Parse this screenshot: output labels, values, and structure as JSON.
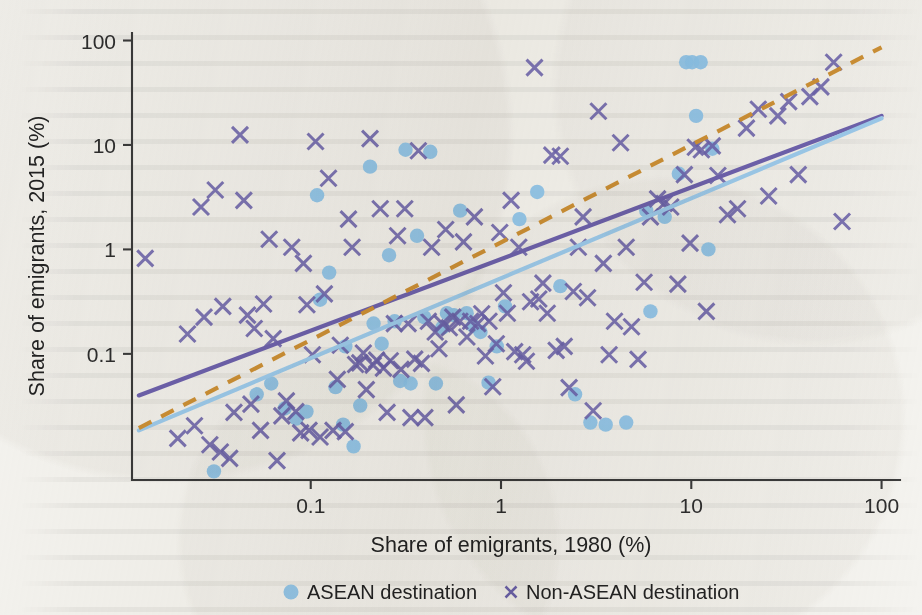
{
  "figure": {
    "background_color": "#f4f3ef",
    "axis_color": "#3b3b3b"
  },
  "chart_data": {
    "type": "scatter",
    "title": "",
    "xlabel": "Share of emigrants, 1980 (%)",
    "ylabel": "Share of emigrants, 2015 (%)",
    "xscale": "log",
    "yscale": "log",
    "xlim": [
      0.0115,
      125
    ],
    "ylim": [
      0.0062,
      118
    ],
    "xticks": [
      0.1,
      1,
      10,
      100
    ],
    "xtick_labels": [
      "0.1",
      "1",
      "10",
      "100"
    ],
    "yticks": [
      0.1,
      1,
      10,
      100
    ],
    "ytick_labels": [
      "0.1",
      "1",
      "10",
      "100"
    ],
    "grid": false,
    "legend_position": "below-axes",
    "colors": {
      "asean": "#8cc3ea",
      "non_asean": "#6c63ad",
      "fit_all": "#6f63b0",
      "fit_asean": "#9ecdf0",
      "fit_non_asean_dashed": "#cf9236"
    },
    "legend": [
      {
        "label": "ASEAN destination",
        "marker": "circle",
        "color": "#8cc3ea"
      },
      {
        "label": "Non-ASEAN destination",
        "marker": "cross",
        "color": "#6c63ad"
      }
    ],
    "series": [
      {
        "name": "ASEAN destination",
        "marker": "circle",
        "color": "#8cc3ea",
        "points": [
          [
            0.031,
            0.0075
          ],
          [
            0.052,
            0.041
          ],
          [
            0.062,
            0.052
          ],
          [
            0.073,
            0.03
          ],
          [
            0.084,
            0.024
          ],
          [
            0.095,
            0.028
          ],
          [
            0.108,
            3.3
          ],
          [
            0.112,
            0.33
          ],
          [
            0.125,
            0.6
          ],
          [
            0.135,
            0.048
          ],
          [
            0.148,
            0.021
          ],
          [
            0.152,
            0.118
          ],
          [
            0.168,
            0.013
          ],
          [
            0.182,
            0.032
          ],
          [
            0.205,
            6.2
          ],
          [
            0.214,
            0.195
          ],
          [
            0.236,
            0.125
          ],
          [
            0.258,
            0.88
          ],
          [
            0.276,
            0.205
          ],
          [
            0.295,
            0.055
          ],
          [
            0.315,
            9.0
          ],
          [
            0.335,
            0.052
          ],
          [
            0.362,
            1.35
          ],
          [
            0.395,
            0.225
          ],
          [
            0.425,
            8.6
          ],
          [
            0.455,
            0.052
          ],
          [
            0.492,
            0.178
          ],
          [
            0.52,
            0.245
          ],
          [
            0.565,
            0.235
          ],
          [
            0.61,
            2.35
          ],
          [
            0.66,
            0.245
          ],
          [
            0.715,
            0.185
          ],
          [
            0.78,
            0.162
          ],
          [
            0.86,
            0.053
          ],
          [
            0.95,
            0.118
          ],
          [
            1.05,
            0.285
          ],
          [
            1.25,
            1.95
          ],
          [
            1.55,
            3.55
          ],
          [
            2.05,
            0.445
          ],
          [
            2.45,
            0.041
          ],
          [
            2.95,
            0.022
          ],
          [
            3.55,
            0.021
          ],
          [
            4.55,
            0.022
          ],
          [
            5.8,
            2.35
          ],
          [
            6.1,
            0.255
          ],
          [
            7.25,
            2.05
          ],
          [
            8.6,
            5.3
          ],
          [
            9.4,
            62
          ],
          [
            10.1,
            62
          ],
          [
            10.6,
            19
          ],
          [
            11.2,
            62
          ],
          [
            12.3,
            1.0
          ],
          [
            12.9,
            9.2
          ]
        ]
      },
      {
        "name": "Non-ASEAN destination",
        "marker": "cross",
        "color": "#6c63ad",
        "points": [
          [
            0.0135,
            0.82
          ],
          [
            0.02,
            0.0155
          ],
          [
            0.0225,
            0.155
          ],
          [
            0.0245,
            0.0205
          ],
          [
            0.0265,
            2.55
          ],
          [
            0.0275,
            0.225
          ],
          [
            0.0295,
            0.0135
          ],
          [
            0.0315,
            3.7
          ],
          [
            0.0335,
            0.0115
          ],
          [
            0.0345,
            0.285
          ],
          [
            0.0375,
            0.01
          ],
          [
            0.0395,
            0.0275
          ],
          [
            0.0425,
            12.5
          ],
          [
            0.0445,
            2.95
          ],
          [
            0.0465,
            0.235
          ],
          [
            0.0485,
            0.033
          ],
          [
            0.0505,
            0.175
          ],
          [
            0.0545,
            0.0185
          ],
          [
            0.0565,
            0.3
          ],
          [
            0.0605,
            1.25
          ],
          [
            0.0635,
            0.14
          ],
          [
            0.0665,
            0.0095
          ],
          [
            0.0705,
            0.0255
          ],
          [
            0.0745,
            0.0355
          ],
          [
            0.0795,
            1.05
          ],
          [
            0.0835,
            0.028
          ],
          [
            0.0885,
            0.0175
          ],
          [
            0.0915,
            0.735
          ],
          [
            0.0955,
            0.295
          ],
          [
            0.098,
            0.0185
          ],
          [
            0.102,
            0.098
          ],
          [
            0.106,
            10.8
          ],
          [
            0.112,
            0.016
          ],
          [
            0.118,
            0.375
          ],
          [
            0.124,
            4.8
          ],
          [
            0.131,
            0.0185
          ],
          [
            0.138,
            0.057
          ],
          [
            0.143,
            0.121
          ],
          [
            0.152,
            0.018
          ],
          [
            0.158,
            1.95
          ],
          [
            0.165,
            1.05
          ],
          [
            0.172,
            0.079
          ],
          [
            0.181,
            0.082
          ],
          [
            0.189,
            0.102
          ],
          [
            0.196,
            0.0455
          ],
          [
            0.205,
            11.5
          ],
          [
            0.213,
            0.078
          ],
          [
            0.222,
            0.087
          ],
          [
            0.232,
            2.45
          ],
          [
            0.241,
            0.073
          ],
          [
            0.252,
            0.0275
          ],
          [
            0.262,
            0.086
          ],
          [
            0.275,
            0.195
          ],
          [
            0.286,
            1.35
          ],
          [
            0.298,
            0.071
          ],
          [
            0.312,
            2.45
          ],
          [
            0.325,
            0.195
          ],
          [
            0.336,
            0.0245
          ],
          [
            0.352,
            0.089
          ],
          [
            0.368,
            8.8
          ],
          [
            0.382,
            0.081
          ],
          [
            0.398,
            0.0245
          ],
          [
            0.415,
            0.205
          ],
          [
            0.432,
            1.05
          ],
          [
            0.451,
            0.162
          ],
          [
            0.472,
            0.112
          ],
          [
            0.492,
            0.195
          ],
          [
            0.512,
            1.55
          ],
          [
            0.535,
            0.178
          ],
          [
            0.558,
            0.225
          ],
          [
            0.582,
            0.0325
          ],
          [
            0.608,
            0.205
          ],
          [
            0.635,
            1.18
          ],
          [
            0.662,
            0.145
          ],
          [
            0.692,
            0.205
          ],
          [
            0.725,
            2.05
          ],
          [
            0.755,
            0.195
          ],
          [
            0.792,
            0.242
          ],
          [
            0.828,
            0.0955
          ],
          [
            0.865,
            0.205
          ],
          [
            0.905,
            0.0485
          ],
          [
            0.945,
            0.125
          ],
          [
            0.985,
            1.45
          ],
          [
            1.03,
            0.385
          ],
          [
            1.08,
            0.245
          ],
          [
            1.13,
            2.95
          ],
          [
            1.18,
            0.105
          ],
          [
            1.24,
            1.05
          ],
          [
            1.3,
            0.098
          ],
          [
            1.36,
            0.085
          ],
          [
            1.43,
            0.315
          ],
          [
            1.5,
            55
          ],
          [
            1.58,
            0.335
          ],
          [
            1.66,
            0.475
          ],
          [
            1.75,
            0.245
          ],
          [
            1.85,
            8.0
          ],
          [
            1.95,
            0.108
          ],
          [
            2.05,
            7.8
          ],
          [
            2.15,
            0.118
          ],
          [
            2.28,
            0.0475
          ],
          [
            2.4,
            0.395
          ],
          [
            2.55,
            1.05
          ],
          [
            2.7,
            2.05
          ],
          [
            2.85,
            0.345
          ],
          [
            3.05,
            0.0285
          ],
          [
            3.25,
            21
          ],
          [
            3.45,
            0.735
          ],
          [
            3.7,
            0.098
          ],
          [
            3.95,
            0.205
          ],
          [
            4.25,
            10.5
          ],
          [
            4.55,
            1.05
          ],
          [
            4.85,
            0.182
          ],
          [
            5.25,
            0.0885
          ],
          [
            5.65,
            0.485
          ],
          [
            6.1,
            2.05
          ],
          [
            6.65,
            3.05
          ],
          [
            7.2,
            2.75
          ],
          [
            7.8,
            2.55
          ],
          [
            8.5,
            0.465
          ],
          [
            9.2,
            5.2
          ],
          [
            9.85,
            1.15
          ],
          [
            10.5,
            9.5
          ],
          [
            11.3,
            9.0
          ],
          [
            12.0,
            0.255
          ],
          [
            12.9,
            9.8
          ],
          [
            13.8,
            5.1
          ],
          [
            15.5,
            2.15
          ],
          [
            17.5,
            2.45
          ],
          [
            19.5,
            14.5
          ],
          [
            22.5,
            22
          ],
          [
            25.5,
            3.25
          ],
          [
            28.5,
            19
          ],
          [
            32.5,
            26
          ],
          [
            36.5,
            5.2
          ],
          [
            42.0,
            29
          ],
          [
            48.0,
            36
          ],
          [
            56.0,
            62
          ],
          [
            62.0,
            1.85
          ]
        ]
      }
    ],
    "fit_lines": [
      {
        "name": "Overall fit",
        "style": "solid",
        "color": "#6f63b0",
        "x0": 0.0125,
        "y0": 0.04,
        "x1": 100.0,
        "y1": 19.0
      },
      {
        "name": "ASEAN fit",
        "style": "solid",
        "color": "#9ecdf0",
        "x0": 0.0125,
        "y0": 0.0185,
        "x1": 100.0,
        "y1": 18.0
      },
      {
        "name": "Non-ASEAN fit",
        "style": "dashed",
        "color": "#cf9236",
        "x0": 0.0125,
        "y0": 0.0195,
        "x1": 100.0,
        "y1": 86.0
      }
    ]
  }
}
